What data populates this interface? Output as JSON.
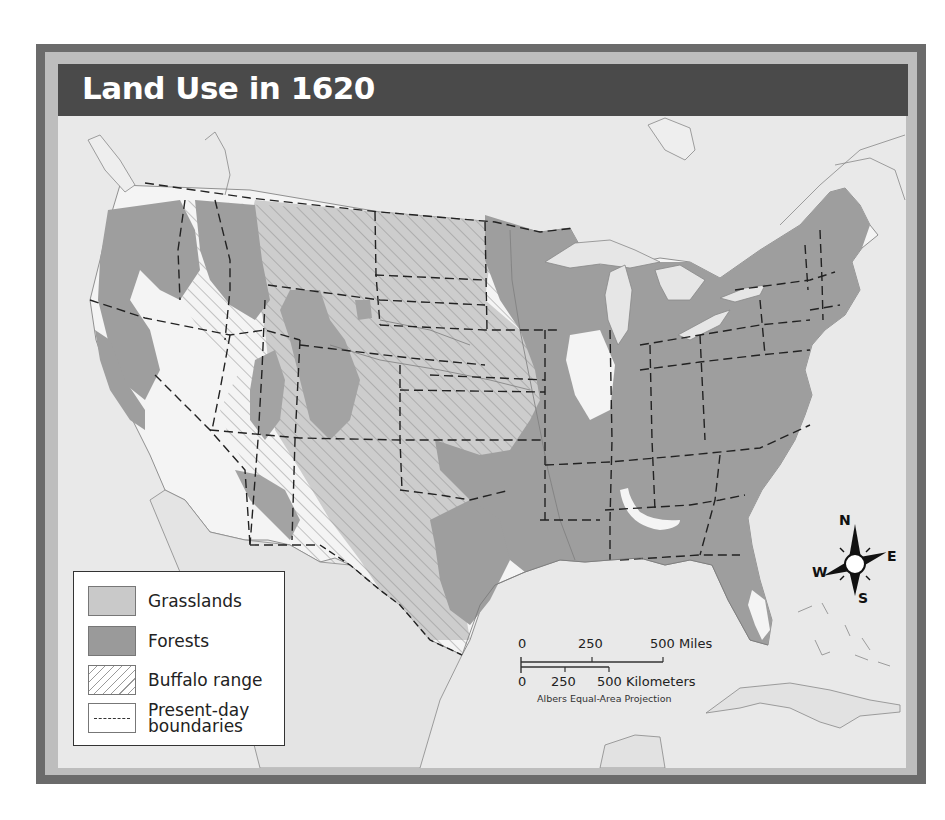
{
  "title": "Land Use in 1620",
  "legend": {
    "items": [
      {
        "label": "Grasslands",
        "swatch": "grasslands",
        "color": "#c9c9c9"
      },
      {
        "label": "Forests",
        "swatch": "forests",
        "color": "#9a9a9a"
      },
      {
        "label": "Buffalo range",
        "swatch": "hatched"
      },
      {
        "label": "Present-day",
        "label2": "boundaries",
        "swatch": "dashed-line"
      }
    ]
  },
  "scale_bar": {
    "miles": {
      "ticks": [
        "0",
        "250",
        "500 Miles"
      ]
    },
    "kilometers": {
      "ticks": [
        "0",
        "250",
        "500 Kilometers"
      ]
    },
    "projection": "Albers Equal-Area Projection"
  },
  "compass": {
    "n": "N",
    "e": "E",
    "s": "S",
    "w": "W"
  },
  "colors": {
    "frame_dark": "#6b6b6b",
    "frame_light": "#bdbdbd",
    "title_bar": "#4a4a4a",
    "water_and_land": "#e9e9e9",
    "grasslands": "#c9c9c9",
    "forests": "#9a9a9a",
    "open_land": "#f4f4f4"
  }
}
